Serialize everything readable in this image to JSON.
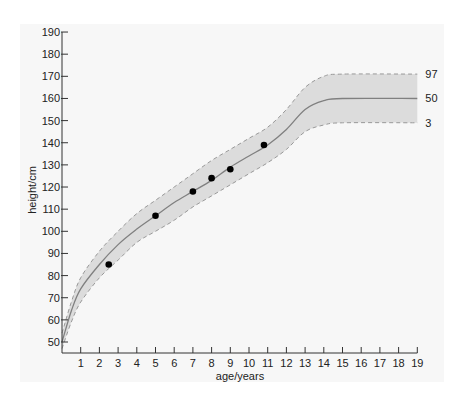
{
  "chart_data": {
    "type": "line",
    "title": "",
    "xlabel": "age/years",
    "ylabel": "height/cm",
    "xlim": [
      0,
      19
    ],
    "ylim": [
      45,
      190
    ],
    "x_ticks": [
      1,
      2,
      3,
      4,
      5,
      6,
      7,
      8,
      9,
      10,
      11,
      12,
      13,
      14,
      15,
      16,
      17,
      18,
      19
    ],
    "y_ticks": [
      50,
      60,
      70,
      80,
      90,
      100,
      110,
      120,
      130,
      140,
      150,
      160,
      170,
      180,
      190
    ],
    "grid": false,
    "legend_position": "right-end-labels",
    "series": [
      {
        "name": "97",
        "style": "dashed",
        "x": [
          0,
          0.5,
          1,
          2,
          3,
          4,
          5,
          6,
          7,
          8,
          9,
          10,
          11,
          12,
          13,
          14,
          15,
          19
        ],
        "values": [
          54,
          68,
          79,
          91,
          100,
          108,
          114,
          120,
          126,
          132,
          137,
          142,
          147,
          155,
          165,
          170,
          171,
          171
        ]
      },
      {
        "name": "50",
        "style": "solid",
        "x": [
          0,
          0.5,
          1,
          2,
          3,
          4,
          5,
          6,
          7,
          8,
          9,
          10,
          11,
          12,
          13,
          14,
          15,
          19
        ],
        "values": [
          50,
          64,
          74,
          85,
          94,
          101,
          107,
          113,
          118,
          123,
          129,
          134,
          139,
          146,
          155,
          159,
          160,
          160
        ]
      },
      {
        "name": "3",
        "style": "dashed",
        "x": [
          0,
          0.5,
          1,
          2,
          3,
          4,
          5,
          6,
          7,
          8,
          9,
          10,
          11,
          12,
          13,
          14,
          15,
          19
        ],
        "values": [
          47,
          59,
          68,
          79,
          87,
          95,
          100,
          105,
          111,
          116,
          121,
          126,
          131,
          137,
          145,
          148,
          149,
          149
        ]
      },
      {
        "name": "measurements",
        "style": "scatter",
        "x": [
          2.5,
          5,
          7,
          8,
          9,
          10.8
        ],
        "values": [
          85,
          107,
          118,
          124,
          128,
          139
        ]
      }
    ],
    "band": {
      "between": [
        "3",
        "97"
      ],
      "fill": "#dcdcdc"
    },
    "end_labels": [
      "97",
      "50",
      "3"
    ]
  },
  "colors": {
    "panel_bg": "#f7f7f7",
    "band_fill": "#dcdcdc",
    "band_edge": "#999999",
    "median_line": "#808080",
    "axis": "#333333",
    "points": "#000000"
  }
}
